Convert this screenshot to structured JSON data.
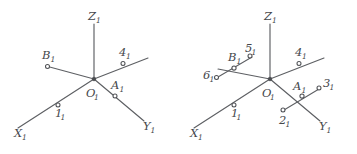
{
  "figure": {
    "background_color": "#ffffff",
    "line_color": "#5d5f63",
    "label_color": "#45474b",
    "width": 357,
    "height": 154
  },
  "diagrams": [
    {
      "id": "left",
      "name": "axonometric-axes-with-two-points",
      "origin_label": {
        "base": "O",
        "sub": "1"
      },
      "axes": [
        {
          "name": "z-axis",
          "base": "Z",
          "sub": "1"
        },
        {
          "name": "x-axis",
          "base": "X",
          "sub": "1"
        },
        {
          "name": "y-axis",
          "base": "Y",
          "sub": "1"
        }
      ],
      "points": [
        {
          "name": "point-B1",
          "base": "B",
          "sub": "1"
        },
        {
          "name": "point-4-1",
          "base": "4",
          "sub": "1"
        },
        {
          "name": "point-A1",
          "base": "A",
          "sub": "1"
        },
        {
          "name": "point-1-1",
          "base": "1",
          "sub": "1"
        }
      ]
    },
    {
      "id": "right",
      "name": "axonometric-axes-with-projection-traces",
      "origin_label": {
        "base": "O",
        "sub": "1"
      },
      "axes": [
        {
          "name": "z-axis",
          "base": "Z",
          "sub": "1"
        },
        {
          "name": "x-axis",
          "base": "X",
          "sub": "1"
        },
        {
          "name": "y-axis",
          "base": "Y",
          "sub": "1"
        }
      ],
      "points": [
        {
          "name": "point-B1",
          "base": "B",
          "sub": "1"
        },
        {
          "name": "point-5-1",
          "base": "5",
          "sub": "1"
        },
        {
          "name": "point-6-1",
          "base": "6",
          "sub": "1"
        },
        {
          "name": "point-4-1",
          "base": "4",
          "sub": "1"
        },
        {
          "name": "point-A1",
          "base": "A",
          "sub": "1"
        },
        {
          "name": "point-3-1",
          "base": "3",
          "sub": "1"
        },
        {
          "name": "point-2-1",
          "base": "2",
          "sub": "1"
        },
        {
          "name": "point-1-1",
          "base": "1",
          "sub": "1"
        }
      ]
    }
  ]
}
